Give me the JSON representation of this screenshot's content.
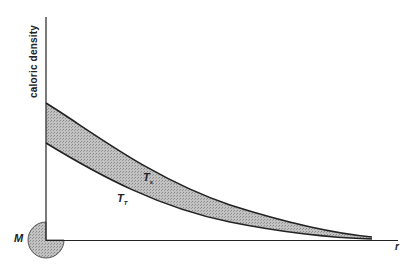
{
  "diagram": {
    "y_axis_label": "caloric density",
    "x_axis_label": "r",
    "mass_label": "M",
    "curves": [
      {
        "name": "upper-curve",
        "label_main": "T",
        "label_sub": "s",
        "start_y_px": 103
      },
      {
        "name": "lower-curve",
        "label_main": "T",
        "label_sub": "T",
        "start_y_px": 143
      }
    ],
    "colors": {
      "line": "#222222",
      "fill": "#b8b8b8",
      "mass_fill": "#c4c4c4",
      "background": "#ffffff"
    }
  }
}
